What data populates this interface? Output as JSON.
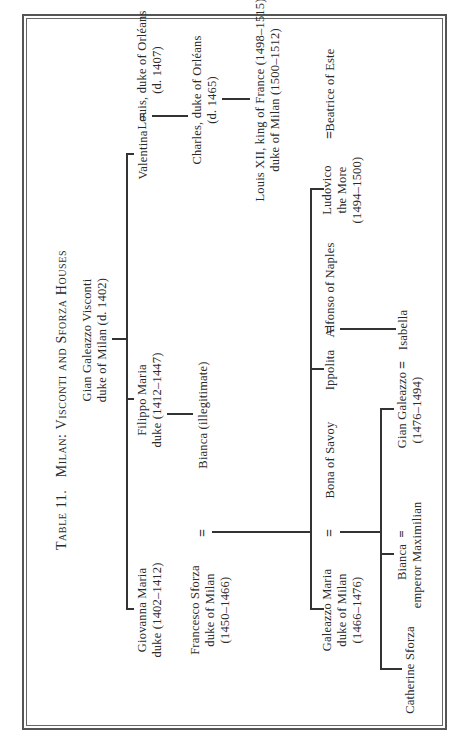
{
  "table": {
    "title_prefix": "Table 11.",
    "title_main": "Milan: Visconti and Sforza Houses",
    "marriage_symbol": "="
  },
  "generation_1": {
    "gian_galeazzo_visconti": {
      "line1": "Gian Galeazzo Visconti",
      "line2": "duke of Milan (d. 1402)"
    }
  },
  "generation_2": {
    "giovanna_maria": {
      "line1": "Giovanna Maria",
      "line2": "duke (1402–1412)"
    },
    "filippo_maria": {
      "line1": "Filippo Maria",
      "line2": "duke (1412–1447)"
    },
    "valentina": {
      "line1": "Valentina"
    },
    "louis_orleans": {
      "line1": "Louis, duke of Orléans",
      "line2": "(d. 1407)"
    }
  },
  "generation_3": {
    "francesco_sforza": {
      "line1": "Francesco Sforza",
      "line2": "duke of Milan",
      "line3": "(1450–1466)"
    },
    "bianca_illegitimate": {
      "line1": "Bianca (illegitimate)"
    },
    "charles_orleans": {
      "line1": "Charles, duke of Orléans",
      "line2": "(d. 1465)"
    }
  },
  "generation_4": {
    "galeazzo_maria": {
      "line1": "Galeazzo Maria",
      "line2": "duke of Milan",
      "line3": "(1466–1476)"
    },
    "bona_of_savoy": {
      "line1": "Bona of Savoy"
    },
    "ippolita": {
      "line1": "Ippolita"
    },
    "alfonso_of_naples": {
      "line1": "Alfonso of Naples"
    },
    "ludovico": {
      "line1": "Ludovico",
      "line2": "the More",
      "line3": "(1494–1500)"
    },
    "beatrice_of_este": {
      "line1": "Beatrice of Este"
    },
    "louis_xii": {
      "line1": "Louis XII, king of France (1498–1515)",
      "line2": "duke of Milan (1500–1512)"
    }
  },
  "generation_5": {
    "catherine_sforza": {
      "line1": "Catherine Sforza"
    },
    "bianca": {
      "line1": "Bianca",
      "line2": "emperor Maximilian"
    },
    "gian_galeazzo": {
      "line1": "Gian Galeazzo",
      "line2": "(1476–1494)"
    },
    "isabella": {
      "line1": "Isabella"
    }
  }
}
